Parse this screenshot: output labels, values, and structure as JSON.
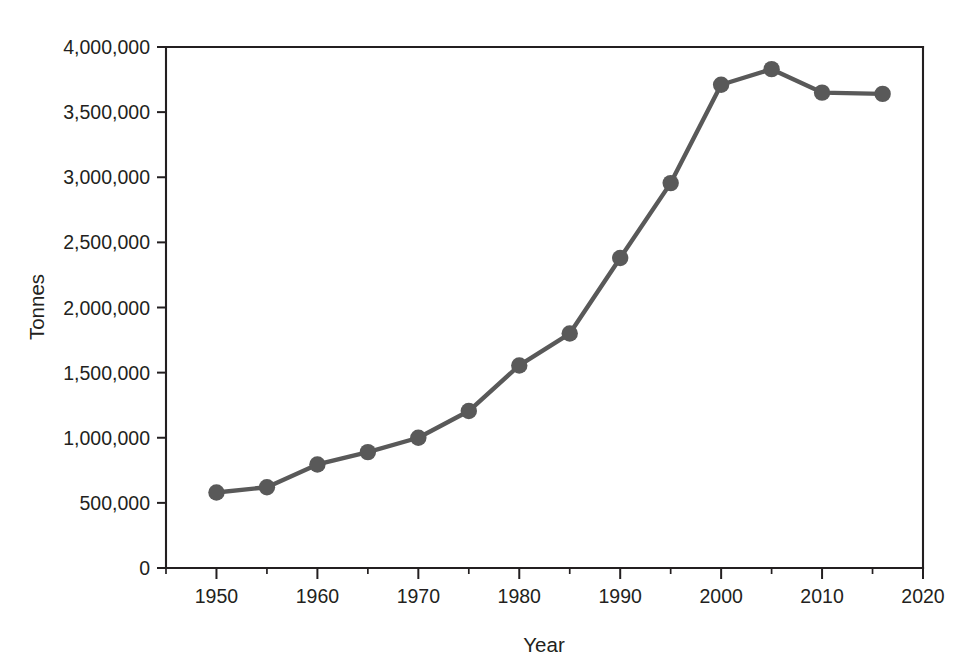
{
  "chart_data": {
    "type": "line",
    "title": "",
    "xlabel": "Year",
    "ylabel": "Tonnes",
    "xlim": [
      1945,
      2020
    ],
    "ylim": [
      0,
      4000000
    ],
    "grid": false,
    "legend": "none",
    "line_color": "#595959",
    "marker": "circle",
    "marker_color": "#595959",
    "x_tick_labels": [
      "1950",
      "1960",
      "1970",
      "1980",
      "1990",
      "2000",
      "2010",
      "2020"
    ],
    "x_major_ticks": [
      1950,
      1960,
      1970,
      1980,
      1990,
      2000,
      2010,
      2020
    ],
    "x_minor_ticks": [
      1945,
      1955,
      1965,
      1975,
      1985,
      1995,
      2005,
      2015
    ],
    "y_tick_labels": [
      "0",
      "500,000",
      "1,000,000",
      "1,500,000",
      "2,000,000",
      "2,500,000",
      "3,000,000",
      "3,500,000",
      "4,000,000"
    ],
    "y_ticks": [
      0,
      500000,
      1000000,
      1500000,
      2000000,
      2500000,
      3000000,
      3500000,
      4000000
    ],
    "x": [
      1950,
      1955,
      1960,
      1965,
      1970,
      1975,
      1980,
      1985,
      1990,
      1995,
      2000,
      2005,
      2010,
      2016
    ],
    "values": [
      580000,
      620000,
      795000,
      890000,
      1000000,
      1205000,
      1555000,
      1800000,
      2380000,
      2955000,
      3710000,
      3830000,
      3650000,
      3640000
    ],
    "series": [
      {
        "name": "Tonnes",
        "values": [
          580000,
          620000,
          795000,
          890000,
          1000000,
          1205000,
          1555000,
          1800000,
          2380000,
          2955000,
          3710000,
          3830000,
          3650000,
          3640000
        ]
      }
    ]
  }
}
